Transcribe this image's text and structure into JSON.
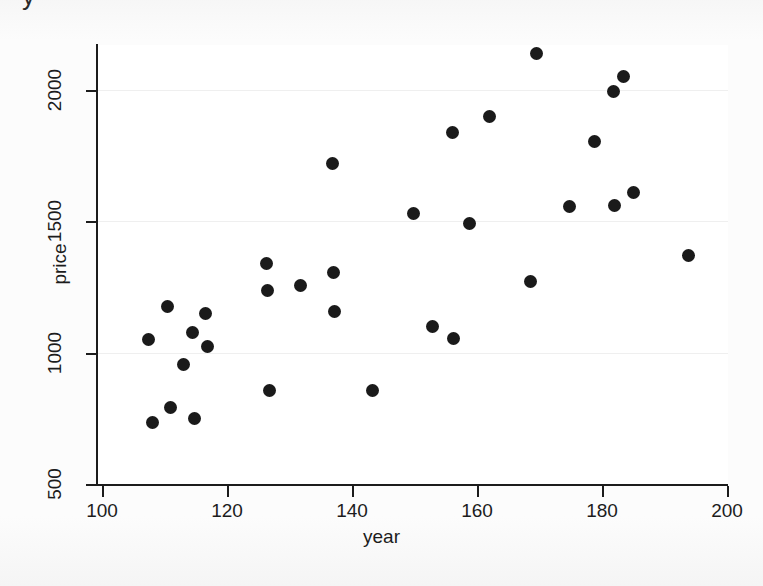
{
  "figure": {
    "top_clipped_glyph": "y",
    "background_color": "#ffffff",
    "marker_color": "#1a1a1a",
    "axis_color": "#1c1c1c",
    "gridline_color": "#efefef"
  },
  "chart_data": {
    "type": "scatter",
    "title": "",
    "xlabel": "year",
    "ylabel": "price",
    "xlim": [
      100,
      200
    ],
    "ylim": [
      500,
      2170
    ],
    "xticks": [
      100,
      120,
      140,
      160,
      180,
      200
    ],
    "yticks": [
      500,
      1000,
      1500,
      2000
    ],
    "xtick_labels": [
      "100",
      "120",
      "140",
      "160",
      "180",
      "200"
    ],
    "ytick_labels": [
      "500",
      "1000",
      "1500",
      "2000"
    ],
    "grid": true,
    "grid_axis": "y",
    "legend": false,
    "marker": "filled-circle",
    "points": [
      {
        "x": 107.5,
        "y": 1050
      },
      {
        "x": 108.0,
        "y": 735
      },
      {
        "x": 110.5,
        "y": 1175
      },
      {
        "x": 111.0,
        "y": 790
      },
      {
        "x": 113.0,
        "y": 955
      },
      {
        "x": 114.5,
        "y": 1075
      },
      {
        "x": 114.8,
        "y": 750
      },
      {
        "x": 116.5,
        "y": 1150
      },
      {
        "x": 116.8,
        "y": 1025
      },
      {
        "x": 126.3,
        "y": 1340
      },
      {
        "x": 126.5,
        "y": 1235
      },
      {
        "x": 126.8,
        "y": 855
      },
      {
        "x": 131.8,
        "y": 1255
      },
      {
        "x": 136.8,
        "y": 1720
      },
      {
        "x": 137.0,
        "y": 1305
      },
      {
        "x": 137.2,
        "y": 1155
      },
      {
        "x": 143.2,
        "y": 855
      },
      {
        "x": 149.8,
        "y": 1530
      },
      {
        "x": 152.8,
        "y": 1100
      },
      {
        "x": 156.0,
        "y": 1840
      },
      {
        "x": 156.2,
        "y": 1055
      },
      {
        "x": 158.8,
        "y": 1490
      },
      {
        "x": 162.0,
        "y": 1900
      },
      {
        "x": 168.5,
        "y": 1270
      },
      {
        "x": 169.5,
        "y": 2140
      },
      {
        "x": 174.8,
        "y": 1555
      },
      {
        "x": 178.8,
        "y": 1805
      },
      {
        "x": 181.8,
        "y": 1995
      },
      {
        "x": 182.0,
        "y": 1560
      },
      {
        "x": 183.5,
        "y": 2050
      },
      {
        "x": 185.0,
        "y": 1610
      },
      {
        "x": 193.8,
        "y": 1370
      }
    ]
  }
}
